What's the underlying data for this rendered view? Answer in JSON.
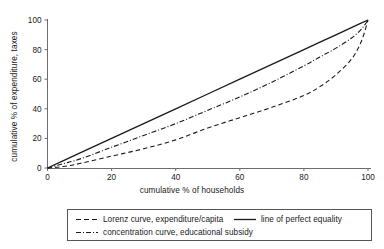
{
  "chart_data": {
    "type": "line",
    "title": "",
    "xlabel": "cumulative % of households",
    "ylabel": "cumulative % of expenditure, taxes",
    "xlim": [
      0,
      100
    ],
    "ylim": [
      0,
      100
    ],
    "xticks": [
      0,
      20,
      40,
      60,
      80,
      100
    ],
    "yticks": [
      0,
      20,
      40,
      60,
      80,
      100
    ],
    "grid": false,
    "legend_position": "below-axes",
    "x": [
      0,
      5,
      10,
      20,
      30,
      40,
      50,
      60,
      70,
      80,
      85,
      90,
      95,
      98,
      100
    ],
    "series": [
      {
        "name": "Lorenz curve, expenditure/capita",
        "style": "dashed",
        "color": "#1a1a1a",
        "values": [
          0,
          1,
          3,
          8,
          13,
          19,
          27,
          34,
          41,
          49,
          55,
          63,
          74,
          86,
          100
        ]
      },
      {
        "name": "line of perfect equality",
        "style": "solid",
        "color": "#1a1a1a",
        "values": [
          0,
          5,
          10,
          20,
          30,
          40,
          50,
          60,
          70,
          80,
          85,
          90,
          95,
          98,
          100
        ]
      },
      {
        "name": "concentration curve, educational subsidy",
        "style": "dash-dot",
        "color": "#1a1a1a",
        "values": [
          0,
          3,
          6,
          14,
          22,
          30,
          39,
          48,
          58,
          69,
          75,
          81,
          88,
          94,
          100
        ]
      }
    ]
  },
  "axes": {
    "x_title": "cumulative % of households",
    "y_title": "cumulative % of expenditure, taxes",
    "x_tick_labels": [
      "0",
      "20",
      "40",
      "60",
      "80",
      "100"
    ],
    "y_tick_labels": [
      "0",
      "20",
      "40",
      "60",
      "80",
      "100"
    ]
  },
  "legend": {
    "entries": [
      {
        "label": "Lorenz curve, expenditure/capita",
        "style": "dashed"
      },
      {
        "label": "line of perfect equality",
        "style": "solid"
      },
      {
        "label": "concentration curve, educational subsidy",
        "style": "dash-dot"
      }
    ]
  },
  "colors": {
    "line": "#1a1a1a",
    "axis": "#6d6d6d",
    "legend_border": "#555555",
    "background": "#ffffff"
  }
}
